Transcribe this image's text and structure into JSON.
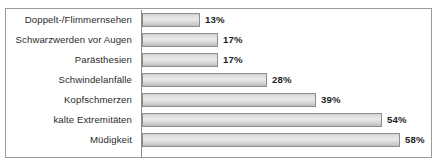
{
  "chart_data": {
    "type": "bar",
    "orientation": "horizontal",
    "title": "",
    "subtitle": "",
    "xlabel": "",
    "ylabel": "",
    "xlim": [
      0,
      64
    ],
    "grid": false,
    "legend": null,
    "value_suffix": "%",
    "categories": [
      "Doppelt-/Flimmernsehen",
      "Schwarzwerden vor Augen",
      "Parästhesien",
      "Schwindelanfälle",
      "Kopfschmerzen",
      "kalte Extremitäten",
      "Müdigkeit"
    ],
    "values": [
      13,
      17,
      17,
      28,
      39,
      54,
      58
    ],
    "value_labels": [
      "13%",
      "17%",
      "17%",
      "28%",
      "39%",
      "54%",
      "58%"
    ],
    "bars": [
      {
        "category": "Doppelt-/Flimmernsehen",
        "value": 13,
        "label": "13%"
      },
      {
        "category": "Schwarzwerden vor Augen",
        "value": 17,
        "label": "17%"
      },
      {
        "category": "Parästhesien",
        "value": 17,
        "label": "17%"
      },
      {
        "category": "Schwindelanfälle",
        "value": 28,
        "label": "28%"
      },
      {
        "category": "Kopfschmerzen",
        "value": 39,
        "label": "39%"
      },
      {
        "category": "kalte Extremitäten",
        "value": 54,
        "label": "54%"
      },
      {
        "category": "Müdigkeit",
        "value": 58,
        "label": "58%"
      }
    ],
    "colors": {
      "bar_fill_light": "#e8e8e8",
      "bar_fill_dark": "#bdbdbd",
      "bar_border": "#8e8e8e",
      "axis_line": "#8c8c8c",
      "frame_border": "#9a9a9a",
      "label_text": "#2b2b2b",
      "value_text": "#1d1d1d",
      "background": "#ffffff"
    }
  }
}
